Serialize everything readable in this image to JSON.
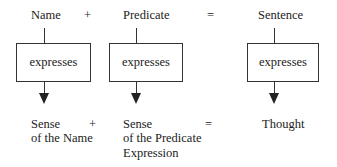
{
  "top_row": {
    "name": "Name",
    "plus": "+",
    "predicate": "Predicate",
    "equals": "=",
    "sentence": "Sentence"
  },
  "boxes": [
    {
      "label": "expresses"
    },
    {
      "label": "expresses"
    },
    {
      "label": "expresses"
    }
  ],
  "bottom_row": {
    "sense_name_line1": "Sense",
    "sense_name_line2": "of the Name",
    "plus": "+",
    "sense_pred_line1": "Sense",
    "sense_pred_line2": "of the Predicate",
    "sense_pred_line3": "Expression",
    "equals": "=",
    "thought": "Thought"
  }
}
